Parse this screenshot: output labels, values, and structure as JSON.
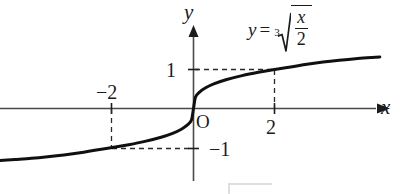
{
  "figure": {
    "kind": "cartesian-plot",
    "background_color": "#ffffff",
    "ink_color": "#1b1b1b",
    "axis_color": "#4a4a4a"
  },
  "axes": {
    "x_axis_label": "x",
    "y_axis_label": "y",
    "origin_label": "O",
    "x_tick_labels": [
      "−2",
      "2"
    ],
    "y_tick_labels": [
      "1",
      "−1"
    ]
  },
  "equation": {
    "lhs": "y",
    "equals": "=",
    "radical_index": "3",
    "numerator": "x",
    "denominator": "2"
  },
  "chart_data": {
    "type": "line",
    "title": "",
    "subtitle": "",
    "xlabel": "x",
    "ylabel": "y",
    "function": "y = (x/2)^(1/3)",
    "grid": false,
    "legend": null,
    "xlim": [
      -5.2,
      4.6
    ],
    "ylim": [
      -1.65,
      1.45
    ],
    "x_ticks": [
      -2,
      2
    ],
    "x_tick_labels": [
      "−2",
      "2"
    ],
    "y_ticks": [
      1,
      -1
    ],
    "y_tick_labels": [
      "1",
      "−1"
    ],
    "annotations": [
      {
        "text": "y = ∛(x/2)",
        "x": 2.3,
        "y": 1.35
      },
      {
        "text": "O",
        "x": 0.12,
        "y": -0.12
      }
    ],
    "guide_lines": [
      {
        "type": "dashed",
        "from": [
          -2,
          0
        ],
        "to": [
          -2,
          -1
        ]
      },
      {
        "type": "dashed",
        "from": [
          -2,
          -1
        ],
        "to": [
          0,
          -1
        ]
      },
      {
        "type": "dashed",
        "from": [
          0,
          1
        ],
        "to": [
          2,
          1
        ]
      },
      {
        "type": "dashed",
        "from": [
          2,
          1
        ],
        "to": [
          2,
          0
        ]
      }
    ],
    "marked_points": [
      {
        "x": -2,
        "y": -1
      },
      {
        "x": 2,
        "y": 1
      },
      {
        "x": 0,
        "y": 0
      }
    ],
    "x": [
      -5.2,
      -4.8,
      -4.4,
      -4.0,
      -3.6,
      -3.2,
      -2.8,
      -2.4,
      -2.0,
      -1.6,
      -1.2,
      -0.8,
      -0.5,
      -0.3,
      -0.15,
      -0.05,
      0,
      0.05,
      0.15,
      0.3,
      0.5,
      0.8,
      1.2,
      1.6,
      2.0,
      2.4,
      2.8,
      3.2,
      3.6,
      4.0,
      4.4,
      4.6
    ],
    "values": [
      -1.366,
      -1.3354,
      -1.3075,
      -1.2779,
      -1.2374,
      -1.1906,
      -1.1347,
      -1.0627,
      -1.0,
      -0.9283,
      -0.8434,
      -0.7368,
      -0.63,
      -0.5313,
      -0.4217,
      -0.2924,
      0,
      0.2924,
      0.4217,
      0.5313,
      0.63,
      0.7368,
      0.8434,
      0.9283,
      1.0,
      1.0627,
      1.1347,
      1.1906,
      1.2374,
      1.2779,
      1.3075,
      1.3224
    ]
  }
}
